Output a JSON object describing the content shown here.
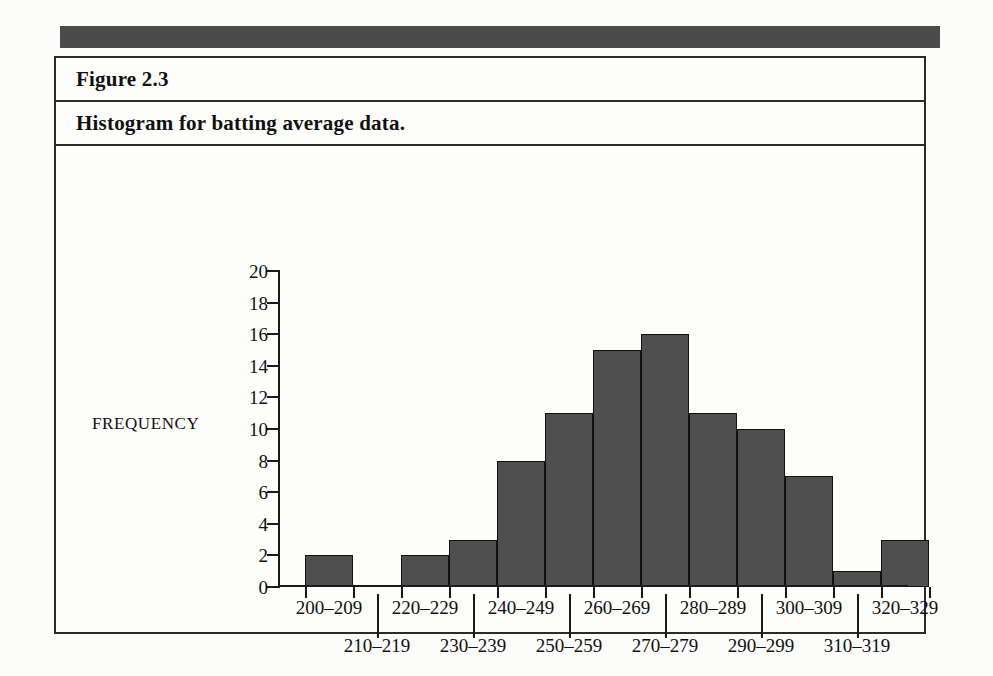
{
  "figure": {
    "label": "Figure 2.3",
    "title": "Histogram for batting average data."
  },
  "colors": {
    "bar_fill": "#4f4f4f",
    "bar_stroke": "#111111",
    "frame": "#2b2b2b",
    "top_bar": "#4b4b4b",
    "axis": "#1a1a1a"
  },
  "chart_data": {
    "type": "bar",
    "title": "Histogram for batting average data.",
    "xlabel": "CLASS INTERVALS",
    "ylabel": "FREQUENCY",
    "categories": [
      "200–209",
      "210–219",
      "220–229",
      "230–239",
      "240–249",
      "250–259",
      "260–269",
      "270–279",
      "280–289",
      "290–299",
      "300–309",
      "310–319",
      "320–329"
    ],
    "values": [
      2,
      0,
      2,
      3,
      8,
      11,
      15,
      16,
      11,
      10,
      7,
      1,
      3
    ],
    "ylim": [
      0,
      20
    ],
    "yticks": [
      0,
      2,
      4,
      6,
      8,
      10,
      12,
      14,
      16,
      18,
      20
    ],
    "grid": false,
    "legend": null
  },
  "axis": {
    "y_title": "FREQUENCY",
    "x_title": "CLASS INTERVALS"
  }
}
